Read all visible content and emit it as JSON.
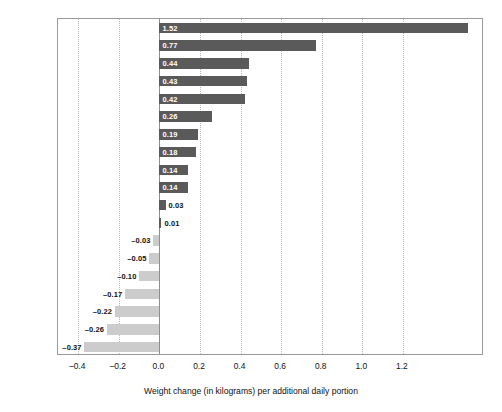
{
  "chart_data": {
    "type": "bar",
    "orientation": "horizontal",
    "title": "",
    "xlabel": "Weight change (in kilograms) per additional daily portion",
    "ylabel": "",
    "xlim": [
      -0.5,
      1.6
    ],
    "xticks": [
      -0.4,
      -0.2,
      0.0,
      0.2,
      0.4,
      0.6,
      0.8,
      1.0,
      1.2
    ],
    "xticklabels": [
      "–0.4",
      "–0.2",
      "0.0",
      "0.2",
      "0.4",
      "0.6",
      "0.8",
      "1.0",
      "1.2"
    ],
    "grid": "vertical-dotted",
    "legend": "none",
    "categories": [
      "French fries",
      "Potato chips",
      "Soft drinks (cola, etc.)",
      "Red meat",
      "Processed meat",
      "Potatoes",
      "Sweets/desserts",
      "White-starch products",
      "Pure fruit juice",
      "Butter",
      "Low-fat/skim milk",
      "Cheese",
      "Full-fat milk",
      "Diet drinks",
      "Vegetables",
      "Whole-grain products",
      "Fruit",
      "Nuts",
      "Yoghurt"
    ],
    "values": [
      1.52,
      0.77,
      0.44,
      0.43,
      0.42,
      0.26,
      0.19,
      0.18,
      0.14,
      0.14,
      0.03,
      0.01,
      -0.03,
      -0.05,
      -0.1,
      -0.17,
      -0.22,
      -0.26,
      -0.37
    ],
    "value_labels": [
      "1.52",
      "0.77",
      "0.44",
      "0.43",
      "0.42",
      "0.26",
      "0.19",
      "0.18",
      "0.14",
      "0.14",
      "0.03",
      "0.01",
      "–0.03",
      "–0.05",
      "–0.10",
      "–0.17",
      "–0.22",
      "–0.26",
      "–0.37"
    ],
    "colors": {
      "positive_bar": "#5a5a5a",
      "negative_bar": "#cccccc",
      "label_inside": "#ffffff",
      "label_outside": "#111111",
      "gridline": "#b9b9b9",
      "zero_line": "#8e8e8e",
      "frame": "#9a9a9a",
      "background": "#ffffff"
    }
  }
}
